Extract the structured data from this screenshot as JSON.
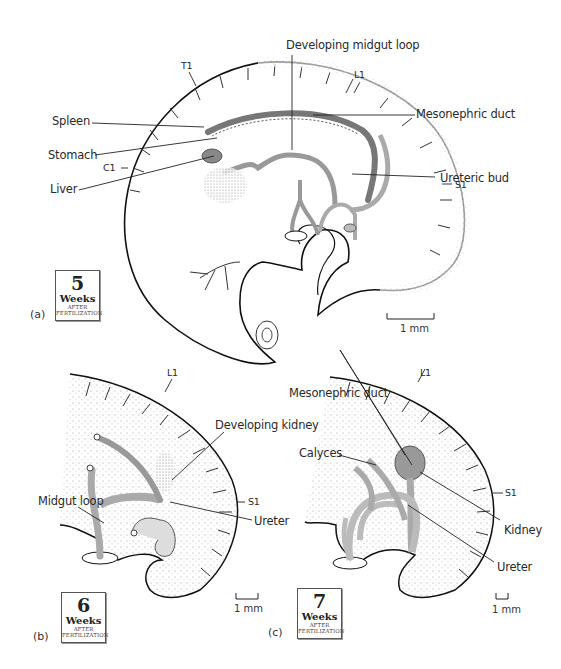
{
  "figure": {
    "panels": [
      {
        "id": "a",
        "panel_label": "(a)",
        "badge": {
          "number": "5",
          "unit": "Weeks",
          "line1": "AFTER",
          "line2": "FERTILIZATION"
        },
        "scale_bar": "1 mm",
        "labels": {
          "t1": "T1",
          "l1": "L1",
          "c1": "C1",
          "s1": "S1",
          "developing_midgut_loop": "Developing midgut loop",
          "spleen": "Spleen",
          "stomach": "Stomach",
          "liver": "Liver",
          "mesonephric_duct": "Mesonephric duct",
          "ureteric_bud": "Ureteric bud"
        }
      },
      {
        "id": "b",
        "panel_label": "(b)",
        "badge": {
          "number": "6",
          "unit": "Weeks",
          "line1": "AFTER",
          "line2": "FERTILIZATION"
        },
        "scale_bar": "1 mm",
        "labels": {
          "l1": "L1",
          "s1": "S1",
          "developing_kidney": "Developing kidney",
          "midgut_loop": "Midgut loop",
          "ureter": "Ureter"
        }
      },
      {
        "id": "c",
        "panel_label": "(c)",
        "badge": {
          "number": "7",
          "unit": "Weeks",
          "line1": "AFTER",
          "line2": "FERTILIZATION"
        },
        "scale_bar": "1 mm",
        "labels": {
          "l1": "L1",
          "s1": "S1",
          "mesonephric_duct": "Mesonephric duct",
          "calyces": "Calyces",
          "kidney": "Kidney",
          "ureter": "Ureter"
        }
      }
    ]
  }
}
